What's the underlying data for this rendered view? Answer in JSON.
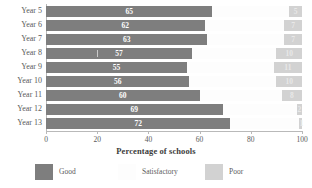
{
  "chart_data": {
    "type": "bar",
    "orientation": "horizontal",
    "stacked": true,
    "title": "",
    "xlabel": "Percentage of schools",
    "ylabel": "",
    "xlim": [
      0,
      100
    ],
    "xticks": [
      0,
      20,
      40,
      60,
      80,
      100
    ],
    "grid": false,
    "legend_position": "bottom",
    "categories": [
      "Year 5",
      "Year 6",
      "Year 7",
      "Year 8",
      "Year 9",
      "Year 10",
      "Year 11",
      "Year 12",
      "Year 13"
    ],
    "series": [
      {
        "name": "Good",
        "color": "#7e7e7e",
        "values": [
          65,
          62,
          63,
          57,
          55,
          56,
          60,
          69,
          72
        ]
      },
      {
        "name": "Satisfactory",
        "color": "#fdfdfd",
        "values": [
          30,
          31,
          30,
          33,
          34,
          34,
          32,
          29,
          27
        ]
      },
      {
        "name": "Poor",
        "color": "#d2d2d2",
        "values": [
          5,
          7,
          7,
          10,
          11,
          10,
          8,
          2,
          1
        ]
      }
    ]
  },
  "axis": {
    "tick_labels": [
      "0",
      "20",
      "40",
      "60",
      "80",
      "100"
    ],
    "title": "Percentage of schools"
  },
  "legend": {
    "items": [
      {
        "label": "Good"
      },
      {
        "label": "Satisfactory"
      },
      {
        "label": "Poor"
      }
    ]
  },
  "rows": [
    {
      "label": "Year 5",
      "good": "65",
      "sat": "",
      "poor": "5"
    },
    {
      "label": "Year 6",
      "good": "62",
      "sat": "",
      "poor": "7"
    },
    {
      "label": "Year 7",
      "good": "63",
      "sat": "",
      "poor": "7"
    },
    {
      "label": "Year 8",
      "good": "57",
      "sat": "",
      "poor": "10"
    },
    {
      "label": "Year 9",
      "good": "55",
      "sat": "",
      "poor": "11"
    },
    {
      "label": "Year 10",
      "good": "56",
      "sat": "",
      "poor": "10"
    },
    {
      "label": "Year 11",
      "good": "60",
      "sat": "",
      "poor": "8"
    },
    {
      "label": "Year 12",
      "good": "69",
      "sat": "",
      "poor": "2"
    },
    {
      "label": "Year 13",
      "good": "72",
      "sat": "",
      "poor": "1"
    }
  ]
}
